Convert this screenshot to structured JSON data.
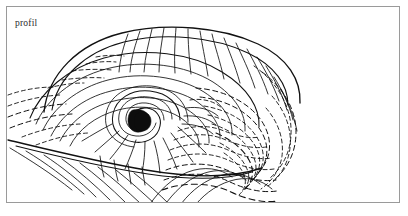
{
  "figure": {
    "caption": "profil",
    "frame": {
      "x": 6,
      "y": 6,
      "width": 394,
      "height": 197,
      "border_color": "#9a9a9a"
    },
    "background_color": "#ffffff",
    "ink_color": "#111111",
    "caption_color": "#2b2b2b",
    "line_styles": [
      "solid",
      "dashed"
    ],
    "core": {
      "name": "shell-apex-dark-core",
      "center_x": 137,
      "center_y": 118,
      "fill_color": "#0d0d0d"
    }
  }
}
